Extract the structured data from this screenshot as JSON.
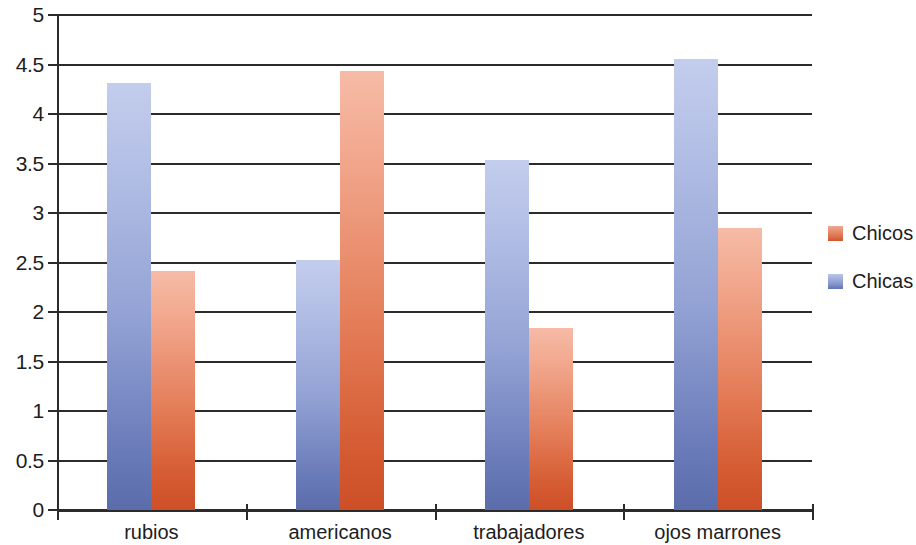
{
  "chart_data": {
    "type": "bar",
    "title": "",
    "subtitle": "",
    "xlabel": "",
    "ylabel": "",
    "categories": [
      "rubios",
      "americanos",
      "trabajadores",
      "ojos marrones"
    ],
    "series": [
      {
        "name": "Chicos",
        "color": "#d2552b",
        "values": [
          2.41,
          4.43,
          1.84,
          2.85
        ]
      },
      {
        "name": "Chicas",
        "color": "#6073b3",
        "values": [
          4.31,
          2.53,
          3.54,
          4.56
        ]
      }
    ],
    "series_plot_order": [
      "Chicas",
      "Chicos"
    ],
    "ylim": [
      0,
      5
    ],
    "ytick_values": [
      0,
      0.5,
      1,
      1.5,
      2,
      2.5,
      3,
      3.5,
      4,
      4.5,
      5
    ],
    "ytick_labels": [
      "0",
      "0.5",
      "1",
      "1.5",
      "2",
      "2.5",
      "3",
      "3.5",
      "4",
      "4.5",
      "5"
    ],
    "grid": "horizontal",
    "legend_position": "right",
    "legend_entries": [
      "Chicos",
      "Chicas"
    ]
  }
}
